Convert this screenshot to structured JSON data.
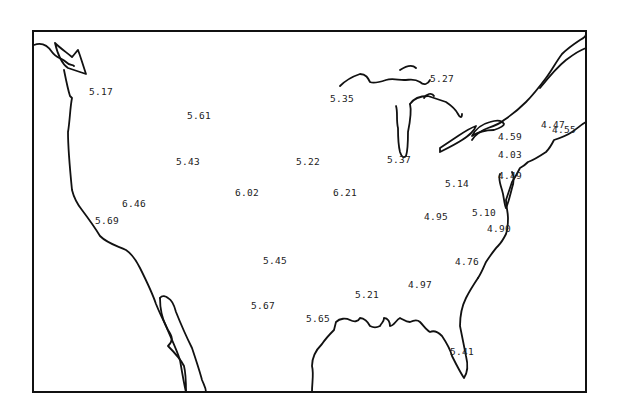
{
  "map": {
    "region": "Contiguous United States",
    "labels": [
      {
        "id": "wa",
        "value": "5.17",
        "x": 89,
        "y": 86
      },
      {
        "id": "mt",
        "value": "5.61",
        "x": 187,
        "y": 110
      },
      {
        "id": "nd",
        "value": "5.35",
        "x": 330,
        "y": 93
      },
      {
        "id": "mi-up",
        "value": "5.27",
        "x": 430,
        "y": 73
      },
      {
        "id": "me",
        "value": "4.55",
        "x": 552,
        "y": 124
      },
      {
        "id": "nh",
        "value": "4.47",
        "x": 541,
        "y": 119
      },
      {
        "id": "wy",
        "value": "5.43",
        "x": 176,
        "y": 156
      },
      {
        "id": "sd",
        "value": "5.22",
        "x": 296,
        "y": 156
      },
      {
        "id": "mi",
        "value": "5.37",
        "x": 387,
        "y": 154
      },
      {
        "id": "ny",
        "value": "4.59",
        "x": 498,
        "y": 131
      },
      {
        "id": "pa",
        "value": "4.03",
        "x": 498,
        "y": 149
      },
      {
        "id": "nj",
        "value": "4.49",
        "x": 498,
        "y": 170
      },
      {
        "id": "oh",
        "value": "5.14",
        "x": 445,
        "y": 178
      },
      {
        "id": "co",
        "value": "6.02",
        "x": 235,
        "y": 187
      },
      {
        "id": "ne",
        "value": "6.21",
        "x": 333,
        "y": 187
      },
      {
        "id": "nv",
        "value": "6.46",
        "x": 122,
        "y": 198
      },
      {
        "id": "ca-n",
        "value": "5.69",
        "x": 95,
        "y": 215
      },
      {
        "id": "ky",
        "value": "4.95",
        "x": 424,
        "y": 211
      },
      {
        "id": "md",
        "value": "5.10",
        "x": 472,
        "y": 207
      },
      {
        "id": "va",
        "value": "4.90",
        "x": 487,
        "y": 223
      },
      {
        "id": "ok",
        "value": "5.45",
        "x": 263,
        "y": 255
      },
      {
        "id": "sc",
        "value": "4.76",
        "x": 455,
        "y": 256
      },
      {
        "id": "ga",
        "value": "4.97",
        "x": 408,
        "y": 279
      },
      {
        "id": "ms",
        "value": "5.21",
        "x": 355,
        "y": 289
      },
      {
        "id": "tx-w",
        "value": "5.67",
        "x": 251,
        "y": 300
      },
      {
        "id": "tx-e",
        "value": "5.65",
        "x": 306,
        "y": 313
      },
      {
        "id": "fl",
        "value": "5.41",
        "x": 450,
        "y": 346
      }
    ]
  }
}
